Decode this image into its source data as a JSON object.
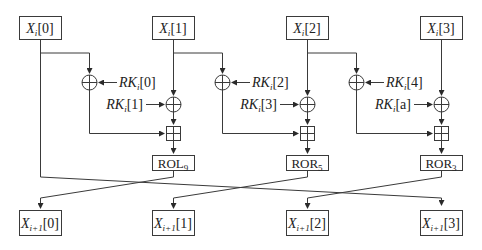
{
  "diagram": {
    "type": "block-cipher-round",
    "inputs": [
      {
        "var": "X",
        "sub": "i",
        "idx": "[0]"
      },
      {
        "var": "X",
        "sub": "i",
        "idx": "[1]"
      },
      {
        "var": "X",
        "sub": "i",
        "idx": "[2]"
      },
      {
        "var": "X",
        "sub": "i",
        "idx": "[3]"
      }
    ],
    "round_keys": [
      {
        "var": "RK",
        "sub": "i",
        "idx": "[0]"
      },
      {
        "var": "RK",
        "sub": "i",
        "idx": "[1]"
      },
      {
        "var": "RK",
        "sub": "i",
        "idx": "[2]"
      },
      {
        "var": "RK",
        "sub": "i",
        "idx": "[3]"
      },
      {
        "var": "RK",
        "sub": "i",
        "idx": "[4]"
      },
      {
        "var": "RK",
        "sub": "i",
        "idx": "[a]"
      }
    ],
    "rotations": [
      {
        "op": "ROL",
        "amount": "9"
      },
      {
        "op": "ROR",
        "amount": "5"
      },
      {
        "op": "ROR",
        "amount": "3"
      }
    ],
    "outputs": [
      {
        "var": "X",
        "sub": "i+1",
        "idx": "[0]"
      },
      {
        "var": "X",
        "sub": "i+1",
        "idx": "[1]"
      },
      {
        "var": "X",
        "sub": "i+1",
        "idx": "[2]"
      },
      {
        "var": "X",
        "sub": "i+1",
        "idx": "[3]"
      }
    ],
    "operators": {
      "xor": "xor-circle-plus",
      "add": "modular-add-boxed-plus"
    },
    "colors": {
      "stroke": "#3a3a3a",
      "text": "#222222",
      "background": "#ffffff"
    }
  }
}
